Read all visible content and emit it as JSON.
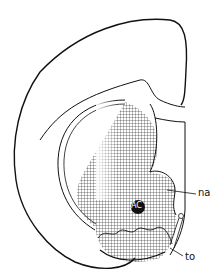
{
  "diagram": {
    "type": "anatomical brain section line drawing",
    "labels": {
      "na": "na",
      "to": "to",
      "ac": "AC"
    },
    "colors": {
      "line": "#111111",
      "background": "#ffffff",
      "hatch": "#222222"
    }
  }
}
